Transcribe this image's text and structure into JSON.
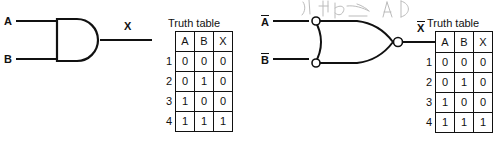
{
  "figure": {
    "ink_color": "#111111",
    "highlight_color": "#9a9a9a"
  },
  "left_circuit": {
    "gate_type": "AND",
    "input_a_label": "A",
    "input_b_label": "B",
    "output_label": "X"
  },
  "left_table": {
    "title": "Truth table",
    "headers": [
      "A",
      "B",
      "X"
    ],
    "row_numbers": [
      "1",
      "2",
      "3",
      "4"
    ],
    "rows": [
      {
        "n": "1",
        "cells": [
          "0",
          "0",
          "0"
        ],
        "highlight": false
      },
      {
        "n": "2",
        "cells": [
          "0",
          "1",
          "0"
        ],
        "highlight": false
      },
      {
        "n": "3",
        "cells": [
          "1",
          "0",
          "0"
        ],
        "highlight": false
      },
      {
        "n": "4",
        "cells": [
          "1",
          "1",
          "1"
        ],
        "highlight": true
      }
    ]
  },
  "right_circuit": {
    "gate_type": "OR with inverted inputs and inverted output",
    "input_a_label": "A",
    "input_b_label": "B",
    "output_label": "X",
    "input_a_overbar": true,
    "input_b_overbar": true,
    "output_overbar": true,
    "annotation": "A  B"
  },
  "right_table": {
    "title": "Truth table",
    "headers": [
      "A",
      "B",
      "X"
    ],
    "headers_overbar": [
      true,
      true,
      true
    ],
    "row_numbers": [
      "1",
      "2",
      "3",
      "4"
    ],
    "rows": [
      {
        "n": "1",
        "cells": [
          "0",
          "0",
          "0"
        ],
        "highlight": true
      },
      {
        "n": "2",
        "cells": [
          "0",
          "1",
          "0"
        ],
        "highlight": true
      },
      {
        "n": "3",
        "cells": [
          "1",
          "0",
          "0"
        ],
        "highlight": true
      },
      {
        "n": "4",
        "cells": [
          "1",
          "1",
          "1"
        ],
        "highlight": false
      }
    ]
  }
}
